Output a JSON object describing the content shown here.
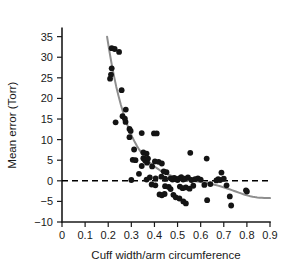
{
  "chart_data": {
    "type": "scatter",
    "title": "",
    "xlabel": "Cuff width/arm circumference",
    "ylabel": "Mean error (Torr)",
    "xlim": [
      0,
      0.9
    ],
    "ylim": [
      -10,
      37
    ],
    "xticks": [
      0,
      0.1,
      0.2,
      0.3,
      0.4,
      0.5,
      0.6,
      0.7,
      0.8,
      0.9
    ],
    "xticklabels": [
      "0",
      "0.1",
      "0.2",
      "0.3",
      "0.4",
      "0.5",
      "0.6",
      "0.7",
      "0.8",
      "0.9"
    ],
    "yticks": [
      -10,
      -5,
      0,
      5,
      10,
      15,
      20,
      25,
      30,
      35
    ],
    "yticklabels": [
      "−10",
      "−5",
      "0",
      "5",
      "10",
      "15",
      "20",
      "25",
      "30",
      "35"
    ],
    "grid": false,
    "legend": null,
    "marker_color": "#141414",
    "curve_color": "#8e8e8e",
    "zero_line_color": "#000000",
    "zero_line_value": 0,
    "zero_line_style": "dashed",
    "points": [
      [
        0.215,
        32.2
      ],
      [
        0.228,
        32.0
      ],
      [
        0.247,
        31.3
      ],
      [
        0.215,
        27.3
      ],
      [
        0.212,
        25.8
      ],
      [
        0.208,
        24.8
      ],
      [
        0.258,
        22.0
      ],
      [
        0.276,
        17.3
      ],
      [
        0.262,
        15.7
      ],
      [
        0.272,
        15.1
      ],
      [
        0.275,
        14.3
      ],
      [
        0.232,
        14.2
      ],
      [
        0.292,
        12.6
      ],
      [
        0.297,
        12.1
      ],
      [
        0.345,
        11.6
      ],
      [
        0.398,
        11.5
      ],
      [
        0.41,
        11.5
      ],
      [
        0.292,
        10.6
      ],
      [
        0.312,
        7.6
      ],
      [
        0.352,
        6.9
      ],
      [
        0.366,
        6.6
      ],
      [
        0.555,
        6.8
      ],
      [
        0.626,
        5.4
      ],
      [
        0.306,
        5.1
      ],
      [
        0.318,
        5.0
      ],
      [
        0.352,
        5.5
      ],
      [
        0.356,
        5.3
      ],
      [
        0.36,
        4.9
      ],
      [
        0.368,
        4.4
      ],
      [
        0.372,
        5.4
      ],
      [
        0.402,
        4.7
      ],
      [
        0.418,
        4.6
      ],
      [
        0.432,
        4.2
      ],
      [
        0.345,
        3.6
      ],
      [
        0.39,
        3.5
      ],
      [
        0.44,
        2.3
      ],
      [
        0.452,
        2.1
      ],
      [
        0.333,
        1.7
      ],
      [
        0.3,
        0.2
      ],
      [
        0.366,
        0.3
      ],
      [
        0.38,
        0.8
      ],
      [
        0.405,
        0.6
      ],
      [
        0.43,
        1.0
      ],
      [
        0.446,
        0.5
      ],
      [
        0.47,
        0.6
      ],
      [
        0.478,
        0.3
      ],
      [
        0.486,
        0.7
      ],
      [
        0.494,
        0.4
      ],
      [
        0.5,
        0.2
      ],
      [
        0.508,
        0.6
      ],
      [
        0.516,
        0.9
      ],
      [
        0.524,
        0.3
      ],
      [
        0.532,
        0.5
      ],
      [
        0.545,
        0.8
      ],
      [
        0.56,
        0.2
      ],
      [
        0.576,
        0.4
      ],
      [
        0.588,
        0.6
      ],
      [
        0.6,
        0.3
      ],
      [
        0.668,
        0.1
      ],
      [
        0.676,
        0.4
      ],
      [
        0.684,
        0.2
      ],
      [
        0.69,
        2.0
      ],
      [
        0.7,
        0.5
      ],
      [
        0.388,
        -0.9
      ],
      [
        0.404,
        -1.1
      ],
      [
        0.446,
        -1.3
      ],
      [
        0.462,
        -1.5
      ],
      [
        0.47,
        -2.0
      ],
      [
        0.51,
        -1.4
      ],
      [
        0.522,
        -1.8
      ],
      [
        0.536,
        -1.6
      ],
      [
        0.552,
        -1.9
      ],
      [
        0.568,
        -1.2
      ],
      [
        0.616,
        -1.0
      ],
      [
        0.642,
        -0.8
      ],
      [
        0.712,
        -1.1
      ],
      [
        0.796,
        -2.3
      ],
      [
        0.8,
        -2.6
      ],
      [
        0.422,
        -3.3
      ],
      [
        0.432,
        -3.5
      ],
      [
        0.444,
        -3.2
      ],
      [
        0.482,
        -3.4
      ],
      [
        0.492,
        -4.0
      ],
      [
        0.508,
        -4.3
      ],
      [
        0.525,
        -5.0
      ],
      [
        0.536,
        -5.5
      ],
      [
        0.628,
        -4.7
      ],
      [
        0.726,
        -3.8
      ],
      [
        0.732,
        -6.0
      ]
    ],
    "fit_curve": [
      [
        0.195,
        35.0
      ],
      [
        0.205,
        31.5
      ],
      [
        0.215,
        28.3
      ],
      [
        0.225,
        25.4
      ],
      [
        0.235,
        22.8
      ],
      [
        0.245,
        20.5
      ],
      [
        0.255,
        18.4
      ],
      [
        0.265,
        16.5
      ],
      [
        0.275,
        14.8
      ],
      [
        0.285,
        13.2
      ],
      [
        0.295,
        11.8
      ],
      [
        0.305,
        10.5
      ],
      [
        0.315,
        9.4
      ],
      [
        0.325,
        8.4
      ],
      [
        0.335,
        7.5
      ],
      [
        0.345,
        6.7
      ],
      [
        0.355,
        6.0
      ],
      [
        0.365,
        5.3
      ],
      [
        0.375,
        4.7
      ],
      [
        0.385,
        4.2
      ],
      [
        0.395,
        3.7
      ],
      [
        0.405,
        3.3
      ],
      [
        0.415,
        2.9
      ],
      [
        0.425,
        2.5
      ],
      [
        0.435,
        2.2
      ],
      [
        0.445,
        1.9
      ],
      [
        0.455,
        1.6
      ],
      [
        0.465,
        1.4
      ],
      [
        0.475,
        1.2
      ],
      [
        0.485,
        1.0
      ],
      [
        0.495,
        0.8
      ],
      [
        0.505,
        0.65
      ],
      [
        0.515,
        0.5
      ],
      [
        0.525,
        0.38
      ],
      [
        0.535,
        0.27
      ],
      [
        0.545,
        0.17
      ],
      [
        0.555,
        0.08
      ],
      [
        0.565,
        0.0
      ],
      [
        0.575,
        -0.08
      ],
      [
        0.585,
        -0.16
      ],
      [
        0.595,
        -0.24
      ],
      [
        0.605,
        -0.33
      ],
      [
        0.615,
        -0.42
      ],
      [
        0.625,
        -0.52
      ],
      [
        0.635,
        -0.63
      ],
      [
        0.645,
        -0.75
      ],
      [
        0.655,
        -0.88
      ],
      [
        0.665,
        -1.02
      ],
      [
        0.675,
        -1.17
      ],
      [
        0.685,
        -1.33
      ],
      [
        0.695,
        -1.5
      ],
      [
        0.705,
        -1.68
      ],
      [
        0.715,
        -1.87
      ],
      [
        0.725,
        -2.06
      ],
      [
        0.735,
        -2.26
      ],
      [
        0.745,
        -2.46
      ],
      [
        0.755,
        -2.66
      ],
      [
        0.765,
        -2.86
      ],
      [
        0.775,
        -3.06
      ],
      [
        0.785,
        -3.25
      ],
      [
        0.795,
        -3.43
      ],
      [
        0.805,
        -3.59
      ],
      [
        0.815,
        -3.73
      ],
      [
        0.825,
        -3.85
      ],
      [
        0.835,
        -3.95
      ],
      [
        0.845,
        -4.03
      ],
      [
        0.855,
        -4.09
      ],
      [
        0.865,
        -4.13
      ],
      [
        0.875,
        -4.16
      ],
      [
        0.885,
        -4.18
      ],
      [
        0.9,
        -4.2
      ]
    ]
  }
}
